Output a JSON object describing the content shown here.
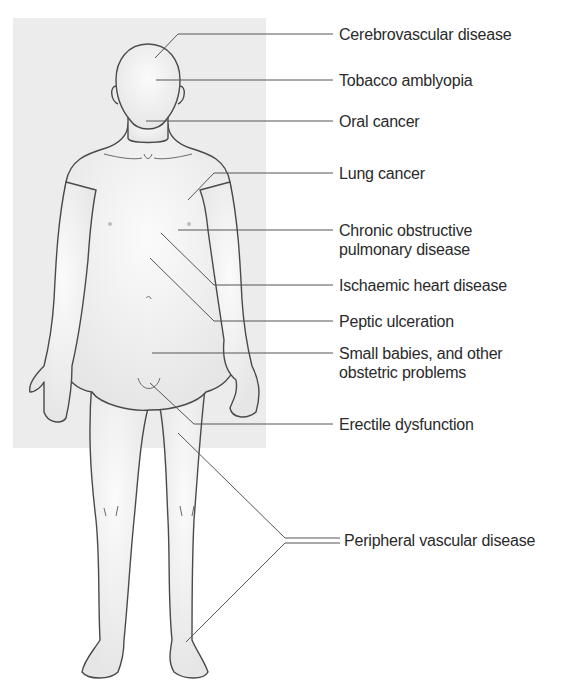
{
  "diagram": {
    "type": "anatomical-annotation",
    "background_panel_color": "#ececec",
    "line_color": "#555555",
    "labels": [
      {
        "id": "cerebrovascular",
        "text": "Cerebrovascular disease",
        "lines": [
          "Cerebrovascular disease"
        ],
        "target": "head/brain"
      },
      {
        "id": "tobacco-amblyopia",
        "text": "Tobacco amblyopia",
        "lines": [
          "Tobacco amblyopia"
        ],
        "target": "eyes"
      },
      {
        "id": "oral-cancer",
        "text": "Oral cancer",
        "lines": [
          "Oral cancer"
        ],
        "target": "mouth"
      },
      {
        "id": "lung-cancer",
        "text": "Lung cancer",
        "lines": [
          "Lung cancer"
        ],
        "target": "upper chest"
      },
      {
        "id": "copd",
        "text": "Chronic obstructive pulmonary disease",
        "lines": [
          "Chronic obstructive",
          "pulmonary disease"
        ],
        "target": "chest"
      },
      {
        "id": "ischaemic-heart",
        "text": "Ischaemic heart disease",
        "lines": [
          "Ischaemic heart disease"
        ],
        "target": "heart"
      },
      {
        "id": "peptic-ulceration",
        "text": "Peptic ulceration",
        "lines": [
          "Peptic ulceration"
        ],
        "target": "stomach"
      },
      {
        "id": "small-babies",
        "text": "Small babies, and other obstetric problems",
        "lines": [
          "Small babies, and other",
          "obstetric problems"
        ],
        "target": "lower abdomen"
      },
      {
        "id": "erectile-dysfunction",
        "text": "Erectile dysfunction",
        "lines": [
          "Erectile dysfunction"
        ],
        "target": "groin"
      },
      {
        "id": "peripheral-vascular",
        "text": "Peripheral vascular disease",
        "lines": [
          "Peripheral vascular disease"
        ],
        "target": "legs (thigh and ankle)"
      }
    ]
  }
}
